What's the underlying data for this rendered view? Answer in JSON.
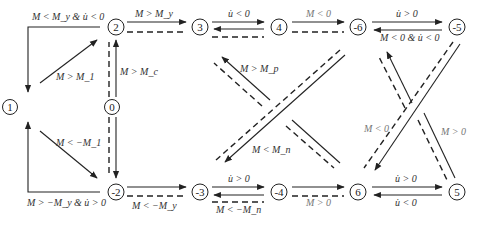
{
  "diagram": {
    "type": "state-transition",
    "nodes": [
      {
        "id": "1",
        "label": "1",
        "x": 10,
        "y": 107
      },
      {
        "id": "0",
        "label": "0",
        "x": 111,
        "y": 107
      },
      {
        "id": "2",
        "label": "2",
        "x": 111,
        "y": 27
      },
      {
        "id": "-2",
        "label": "-2",
        "x": 111,
        "y": 192
      },
      {
        "id": "3",
        "label": "3",
        "x": 200,
        "y": 27
      },
      {
        "id": "-3",
        "label": "-3",
        "x": 200,
        "y": 192
      },
      {
        "id": "4",
        "label": "4",
        "x": 280,
        "y": 27
      },
      {
        "id": "-4",
        "label": "-4",
        "x": 280,
        "y": 192
      },
      {
        "id": "-6",
        "label": "-6",
        "x": 358,
        "y": 27
      },
      {
        "id": "6",
        "label": "6",
        "x": 358,
        "y": 192
      },
      {
        "id": "-5",
        "label": "-5",
        "x": 457,
        "y": 27
      },
      {
        "id": "5",
        "label": "5",
        "x": 457,
        "y": 192
      }
    ],
    "labels": {
      "c_2_1": "M < M_y & u̇ < 0",
      "c_1_2": "M > M_1",
      "c_0_2": "M > M_c",
      "c_2_3": "M > M_y",
      "c_3_4": "u̇ < 0",
      "c_4_n6": "M < 0",
      "c_n6_n5": "u̇ > 0",
      "c_n5_n6": "M < 0 & u̇ < 0",
      "c_1_n2": "M < −M_1",
      "c_n2_1": "M > −M_y & u̇ > 0",
      "c_n2_n3": "M < −M_y",
      "c_n3_n4": "u̇ > 0",
      "c_n4_n3": "M < −M_n",
      "c_n4_6": "M > 0",
      "c_6_5": "u̇ > 0",
      "c_5_6": "u̇ < 0",
      "c_mid_up": "M > M_p",
      "c_mid_down": "M < M_n",
      "c_right_down": "M < 0",
      "c_right_up": "M > 0"
    }
  }
}
